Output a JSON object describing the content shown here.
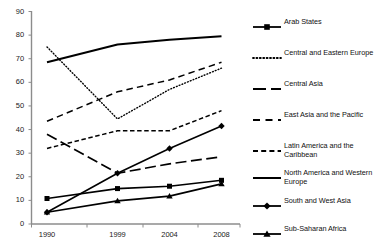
{
  "chart_data": {
    "type": "line",
    "title": "",
    "subtitle": "",
    "xlabel": "",
    "ylabel": "",
    "x": [
      "1990",
      "1999",
      "2004",
      "2008"
    ],
    "categories": [
      "1990",
      "1999",
      "2004",
      "2008"
    ],
    "ylim": [
      0,
      90
    ],
    "yticks": [
      0,
      10,
      20,
      30,
      40,
      50,
      60,
      70,
      80,
      90
    ],
    "ytick_labels": [
      "0",
      "10",
      "20",
      "30",
      "40",
      "50",
      "60",
      "70",
      "80",
      "90"
    ],
    "grid": false,
    "legend_position": "right",
    "series": [
      {
        "name": "Arab States",
        "values": [
          10.8,
          15.0,
          16.0,
          18.5
        ],
        "style": "solid",
        "marker": "square",
        "width": 1.6,
        "color": "#000000"
      },
      {
        "name": "Central and Eastern Europe",
        "values": [
          75.0,
          44.5,
          57.0,
          66.0
        ],
        "style": "dotted",
        "marker": "none",
        "width": 1.4,
        "color": "#000000"
      },
      {
        "name": "Central Asia",
        "values": [
          38.0,
          21.5,
          25.5,
          28.5
        ],
        "style": "long-dash",
        "marker": "none",
        "width": 1.7,
        "color": "#000000"
      },
      {
        "name": "East Asia and the Pacific",
        "values": [
          43.5,
          56.0,
          61.0,
          68.5
        ],
        "style": "dash",
        "marker": "none",
        "width": 1.5,
        "color": "#000000"
      },
      {
        "name": "Latin America and the Caribbean",
        "values": [
          32.0,
          39.5,
          39.5,
          48.0
        ],
        "style": "short-dash",
        "marker": "none",
        "width": 1.5,
        "color": "#000000"
      },
      {
        "name": "North America and Western Europe",
        "values": [
          68.5,
          76.0,
          78.0,
          79.5
        ],
        "style": "solid",
        "marker": "none",
        "width": 2.0,
        "color": "#000000"
      },
      {
        "name": "South and West Asia",
        "values": [
          5.0,
          21.5,
          32.0,
          41.5
        ],
        "style": "solid",
        "marker": "diamond",
        "width": 1.6,
        "color": "#000000"
      },
      {
        "name": "Sub-Saharan Africa",
        "values": [
          5.0,
          9.8,
          11.8,
          17.0
        ],
        "style": "solid",
        "marker": "triangle",
        "width": 1.6,
        "color": "#000000"
      }
    ]
  },
  "axes": {
    "y_labels": [
      "90",
      "80",
      "70",
      "60",
      "50",
      "40",
      "30",
      "20",
      "10",
      "0"
    ],
    "x_labels": [
      "1990",
      "1999",
      "2004",
      "2008"
    ],
    "axis_color": "#808080"
  },
  "legend": {
    "items": [
      {
        "label": "Arab States",
        "swatch": "solid-square"
      },
      {
        "label": "Central and Eastern Europe",
        "swatch": "dotted"
      },
      {
        "label": "Central Asia",
        "swatch": "long-dash"
      },
      {
        "label": "East Asia and the Pacific",
        "swatch": "dash"
      },
      {
        "label": "Latin America and the\nCaribbean",
        "swatch": "short-dash"
      },
      {
        "label": "North America and Western\nEurope",
        "swatch": "solid-thick"
      },
      {
        "label": "South and West Asia",
        "swatch": "solid-diamond"
      },
      {
        "label": "Sub-Saharan Africa",
        "swatch": "solid-triangle"
      }
    ]
  }
}
